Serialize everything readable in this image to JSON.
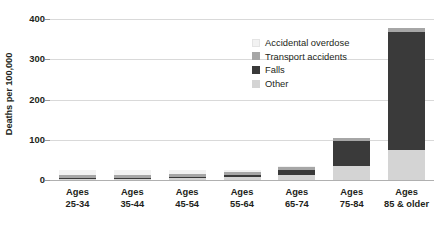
{
  "chart_data": {
    "type": "bar",
    "title": "",
    "subtitle": "",
    "xlabel": "",
    "ylabel": "Deaths per 100,000",
    "ylim": [
      0,
      400
    ],
    "yticks": [
      0,
      100,
      200,
      300,
      400
    ],
    "ytick_labels": [
      "0",
      "100",
      "200",
      "300",
      "400"
    ],
    "grid": true,
    "stacked": true,
    "legend_position": "inside-top-right",
    "categories": [
      "Ages 25-34",
      "Ages 35-44",
      "Ages 45-54",
      "Ages 55-64",
      "Ages 65-74",
      "Ages 75-84",
      "Ages 85 & older"
    ],
    "category_lines": [
      [
        "Ages",
        "25-34"
      ],
      [
        "Ages",
        "35-44"
      ],
      [
        "Ages",
        "45-54"
      ],
      [
        "Ages",
        "55-64"
      ],
      [
        "Ages",
        "65-74"
      ],
      [
        "Ages",
        "75-84"
      ],
      [
        "Ages",
        "85 & older"
      ]
    ],
    "series": [
      {
        "name": "Accidental overdose",
        "color": "#f2f2f2",
        "values": [
          14,
          13,
          11,
          6,
          2,
          1,
          1
        ]
      },
      {
        "name": "Transport accidents",
        "color": "#a6a6a6",
        "values": [
          8,
          8,
          8,
          8,
          8,
          8,
          9
        ]
      },
      {
        "name": "Falls",
        "color": "#3a3a3a",
        "values": [
          1,
          1,
          3,
          5,
          11,
          62,
          293
        ]
      },
      {
        "name": "Other",
        "color": "#d4d4d4",
        "values": [
          3,
          3,
          4,
          7,
          13,
          34,
          75
        ]
      }
    ],
    "totals": [
      26,
      25,
      26,
      26,
      34,
      105,
      378
    ]
  },
  "legend": {
    "items": [
      {
        "label": "Accidental overdose",
        "color": "#f2f2f2"
      },
      {
        "label": "Transport accidents",
        "color": "#a6a6a6"
      },
      {
        "label": "Falls",
        "color": "#3a3a3a"
      },
      {
        "label": "Other",
        "color": "#d4d4d4"
      }
    ]
  },
  "colors": {
    "gridline": "#d9d9d9",
    "baseline": "#b0b0b0",
    "text": "#231f20",
    "background": "#ffffff"
  }
}
